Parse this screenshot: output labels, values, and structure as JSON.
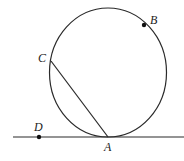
{
  "diagram": {
    "type": "geometry",
    "colors": {
      "stroke": "#2a2a2a",
      "background": "#ffffff"
    },
    "circle": {
      "cx": 108,
      "cy": 72.5,
      "rx": 58.5,
      "ry": 64.5
    },
    "tangent_line": {
      "x1": 13,
      "y1": 137,
      "x2": 184,
      "y2": 137
    },
    "chord": {
      "from": "C",
      "to": "A"
    },
    "points": {
      "A": {
        "label": "A",
        "x": 108,
        "y": 137,
        "dot": false,
        "label_x": 104,
        "label_y": 151
      },
      "B": {
        "label": "B",
        "x": 144,
        "y": 25,
        "dot": true,
        "label_x": 150,
        "label_y": 24
      },
      "C": {
        "label": "C",
        "x": 51,
        "y": 61,
        "dot": false,
        "label_x": 38,
        "label_y": 62
      },
      "D": {
        "label": "D",
        "x": 39,
        "y": 137,
        "dot": true,
        "label_x": 34,
        "label_y": 131
      }
    }
  }
}
